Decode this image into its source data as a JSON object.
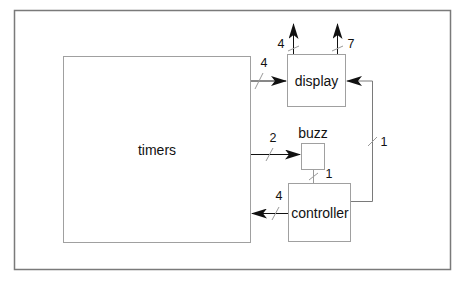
{
  "diagram": {
    "blocks": {
      "timers": {
        "label": "timers"
      },
      "display": {
        "label": "display"
      },
      "buzz": {
        "label": "buzz"
      },
      "controller": {
        "label": "controller"
      }
    },
    "connections": [
      {
        "from": "timers",
        "to": "display",
        "width": "4"
      },
      {
        "from": "timers",
        "to": "buzz",
        "width": "2"
      },
      {
        "from": "controller",
        "to": "buzz",
        "width": "1"
      },
      {
        "from": "controller",
        "to": "timers",
        "width": "4"
      },
      {
        "from": "controller",
        "to": "display",
        "width": "1"
      },
      {
        "from": "display",
        "to": "output-left",
        "width": "4"
      },
      {
        "from": "display",
        "to": "output-right",
        "width": "7"
      }
    ],
    "colors": {
      "frame": "#7a7a7a",
      "box": "#a0a0a0",
      "arrow": "#111111"
    }
  }
}
